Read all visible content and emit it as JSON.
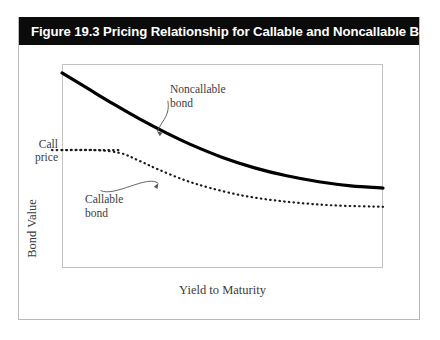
{
  "figure": {
    "title": "Figure 19.3 Pricing Relationship for Callable and Noncallable Bonds",
    "title_bar_color": "#0b0b0b",
    "title_text_color": "#ffffff",
    "border_color": "#b9b9b9",
    "background_color": "#ffffff"
  },
  "chart_data": {
    "type": "line",
    "title": "Figure 19.3 Pricing Relationship for Callable and Noncallable Bonds",
    "subtitle": "",
    "xlabel": "Yield to Maturity",
    "ylabel": "Bond Value",
    "grid": false,
    "legend": "none",
    "axis_tick_labels": {
      "y": [
        "Call price"
      ],
      "x": []
    },
    "xlim": [
      0,
      100
    ],
    "ylim": [
      0,
      100
    ],
    "series": [
      {
        "name": "Noncallable bond",
        "style": "solid",
        "color": "#000000",
        "width": 3.2,
        "x": [
          0,
          8,
          16,
          24,
          32,
          40,
          50,
          60,
          70,
          80,
          90,
          100
        ],
        "y": [
          95.6,
          88.0,
          80.4,
          73.2,
          66.6,
          60.6,
          54.2,
          49.1,
          45.2,
          42.3,
          40.3,
          39.2
        ]
      },
      {
        "name": "Callable bond",
        "style": "dotted",
        "color": "#1a1a1a",
        "width": 2.2,
        "x": [
          0,
          10,
          18,
          24,
          30,
          38,
          46,
          56,
          66,
          76,
          86,
          100
        ],
        "y": [
          57.8,
          57.8,
          56.4,
          52.6,
          48.3,
          43.2,
          39.3,
          35.6,
          33.2,
          31.6,
          30.6,
          30.0
        ]
      }
    ],
    "annotations": [
      {
        "name": "noncallable-bond-annotation",
        "lines": [
          "Noncallable",
          "bond"
        ],
        "text_at": [
          33,
          88
        ],
        "points_to": [
          29.6,
          67.0
        ]
      },
      {
        "name": "callable-bond-annotation",
        "lines": [
          "Callable",
          "bond"
        ],
        "text_at": [
          7,
          33
        ],
        "points_to": [
          30.0,
          41.5
        ]
      }
    ],
    "reference_lines": [
      {
        "name": "call-price-level",
        "label": "Call price",
        "orientation": "horizontal",
        "value": 57.8,
        "style": "dotted"
      }
    ]
  },
  "labels": {
    "call_price_line1": "Call",
    "call_price_line2": "price",
    "y_axis": "Bond Value",
    "x_axis": "Yield to Maturity",
    "noncallable_line1": "Noncallable",
    "noncallable_line2": "bond",
    "callable_line1": "Callable",
    "callable_line2": "bond"
  }
}
